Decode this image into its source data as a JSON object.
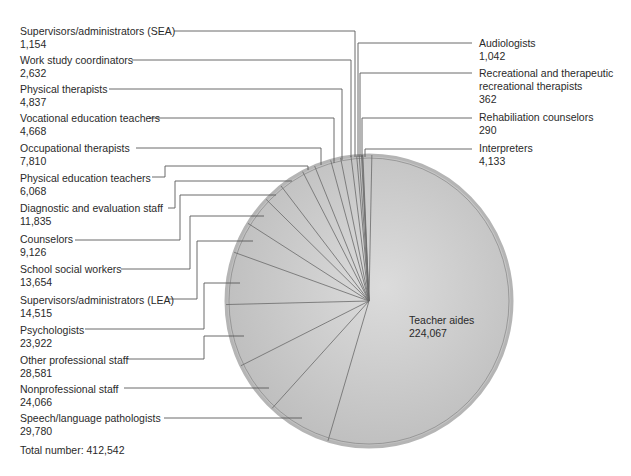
{
  "chart_data": {
    "type": "pie",
    "title": "",
    "total_label": "Total number: 412,542",
    "total": 412542,
    "slices": [
      {
        "name": "Teacher aides",
        "value": 224067,
        "display": "224,067"
      },
      {
        "name": "Speech/language pathologists",
        "value": 29780,
        "display": "29,780"
      },
      {
        "name": "Nonprofessional staff",
        "value": 24066,
        "display": "24,066"
      },
      {
        "name": "Other professional staff",
        "value": 28581,
        "display": "28,581"
      },
      {
        "name": "Psychologists",
        "value": 23922,
        "display": "23,922"
      },
      {
        "name": "Supervisors/administrators (LEA)",
        "value": 14515,
        "display": "14,515"
      },
      {
        "name": "School social workers",
        "value": 13654,
        "display": "13,654"
      },
      {
        "name": "Counselors",
        "value": 9126,
        "display": "9,126"
      },
      {
        "name": "Diagnostic and evaluation staff",
        "value": 11835,
        "display": "11,835"
      },
      {
        "name": "Physical education teachers",
        "value": 6068,
        "display": "6,068"
      },
      {
        "name": "Occupational therapists",
        "value": 7810,
        "display": "7,810"
      },
      {
        "name": "Vocational education teachers",
        "value": 4668,
        "display": "4,668"
      },
      {
        "name": "Physical therapists",
        "value": 4837,
        "display": "4,837"
      },
      {
        "name": "Work study coordinators",
        "value": 2632,
        "display": "2,632"
      },
      {
        "name": "Supervisors/administrators (SEA)",
        "value": 1154,
        "display": "1,154"
      },
      {
        "name": "Audiologists",
        "value": 1042,
        "display": "1,042"
      },
      {
        "name": "Recreational and therapeutic recreational therapists",
        "value": 362,
        "display": "362"
      },
      {
        "name": "Rehabiliation counselors",
        "value": 290,
        "display": "290"
      },
      {
        "name": "Interpreters",
        "value": 4133,
        "display": "4,133"
      }
    ],
    "colors": {
      "fill": "#c4c4c4",
      "fill_light": "#d8d8d8",
      "edge": "#555555",
      "leader": "#555555"
    }
  },
  "labels": {
    "left": [
      {
        "name": "Supervisors/administrators (SEA)",
        "value": "1,154"
      },
      {
        "name": "Work study coordinators",
        "value": "2,632"
      },
      {
        "name": "Physical therapists",
        "value": "4,837"
      },
      {
        "name": "Vocational education teachers",
        "value": "4,668"
      },
      {
        "name": "Occupational therapists",
        "value": "7,810"
      },
      {
        "name": "Physical education teachers",
        "value": "6,068"
      },
      {
        "name": "Diagnostic and evaluation staff",
        "value": "11,835"
      },
      {
        "name": "Counselors",
        "value": "9,126"
      },
      {
        "name": "School social workers",
        "value": "13,654"
      },
      {
        "name": "Supervisors/administrators (LEA)",
        "value": "14,515"
      },
      {
        "name": "Psychologists",
        "value": "23,922"
      },
      {
        "name": "Other professional staff",
        "value": "28,581"
      },
      {
        "name": "Nonprofessional staff",
        "value": "24,066"
      },
      {
        "name": "Speech/language pathologists",
        "value": "29,780"
      }
    ],
    "right": [
      {
        "name": "Audiologists",
        "value": "1,042"
      },
      {
        "name": "Recreational and therapeutic",
        "name2": "recreational therapists",
        "value": "362"
      },
      {
        "name": "Rehabiliation counselors",
        "value": "290"
      },
      {
        "name": "Interpreters",
        "value": "4,133"
      }
    ],
    "inside": {
      "name": "Teacher aides",
      "value": "224,067"
    },
    "total": "Total number: 412,542"
  }
}
